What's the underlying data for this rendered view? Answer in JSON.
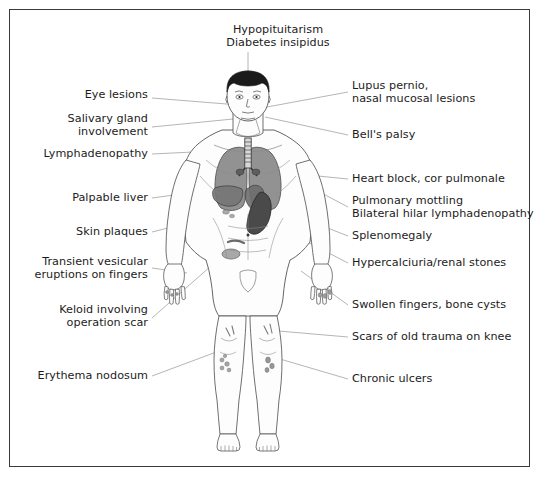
{
  "diagram": {
    "title_label": {
      "text": "Hypopituitarism\nDiabetes insipidus",
      "x": 278,
      "y": 30,
      "anchor": "center"
    },
    "colors": {
      "border": "#3a3a3a",
      "background": "#ffffff",
      "text": "#1c1c1c",
      "leader_line": "#8d8d8d",
      "body_outline": "#555555",
      "skin_fill": "#fdfdfd",
      "hair": "#1a1a1a",
      "lung": "#8a8a8a",
      "lung_outline": "#4a4a4a",
      "liver": "#767676",
      "spleen": "#4a4a4a",
      "organ_mid": "#9a9a9a",
      "lesion": "#9b9b9b"
    },
    "labels_left": [
      {
        "id": "eye-lesions",
        "text": "Eye lesions",
        "x": 148,
        "y": 94,
        "lines": 1
      },
      {
        "id": "salivary-gland-involvement",
        "text": "Salivary gland\ninvolvement",
        "x": 148,
        "y": 118,
        "lines": 2
      },
      {
        "id": "lymphadenopathy",
        "text": "Lymphadenopathy",
        "x": 148,
        "y": 150,
        "lines": 1
      },
      {
        "id": "palpable-liver",
        "text": "Palpable liver",
        "x": 148,
        "y": 194,
        "lines": 1
      },
      {
        "id": "skin-plaques",
        "text": "Skin plaques",
        "x": 148,
        "y": 228,
        "lines": 1
      },
      {
        "id": "transient-vesicular-eruptions-on-fingers",
        "text": "Transient vesicular\neruptions on fingers",
        "x": 148,
        "y": 260,
        "lines": 2
      },
      {
        "id": "keloid-involving-operation-scar",
        "text": "Keloid involving\noperation scar",
        "x": 148,
        "y": 308,
        "lines": 2
      },
      {
        "id": "erythema-nodosum",
        "text": "Erythema nodosum",
        "x": 148,
        "y": 372,
        "lines": 1
      }
    ],
    "labels_right": [
      {
        "id": "lupus-pernio-nasal-mucosal-lesions",
        "text": "Lupus pernio,\nnasal mucosal lesions",
        "x": 352,
        "y": 84,
        "lines": 2
      },
      {
        "id": "bells-palsy",
        "text": "Bell's palsy",
        "x": 352,
        "y": 131,
        "lines": 1
      },
      {
        "id": "heart-block-cor-pulmonale",
        "text": "Heart block, cor pulmonale",
        "x": 352,
        "y": 175,
        "lines": 1
      },
      {
        "id": "pulmonary-mottling-bilateral-hilar-lymphadenopathy",
        "text": "Pulmonary mottling\nBilateral hilar lymphadenopathy",
        "x": 352,
        "y": 199,
        "lines": 2
      },
      {
        "id": "splenomegaly",
        "text": "Splenomegaly",
        "x": 352,
        "y": 232,
        "lines": 1
      },
      {
        "id": "hypercalciuria-renal-stones",
        "text": "Hypercalciuria/renal stones",
        "x": 352,
        "y": 259,
        "lines": 1
      },
      {
        "id": "swollen-fingers-bone-cysts",
        "text": "Swollen fingers, bone cysts",
        "x": 352,
        "y": 301,
        "lines": 1
      },
      {
        "id": "scars-of-old-trauma-on-knee",
        "text": "Scars of old trauma on knee",
        "x": 352,
        "y": 333,
        "lines": 1
      },
      {
        "id": "chronic-ulcers",
        "text": "Chronic ulcers",
        "x": 352,
        "y": 375,
        "lines": 1
      }
    ],
    "leader_lines": [
      {
        "id": "leader-hypopituitarism",
        "points": "248,52 248,74"
      },
      {
        "id": "leader-eye-lesions",
        "points": "152,98 238,106"
      },
      {
        "id": "leader-salivary-gland",
        "points": "152,127 232,120"
      },
      {
        "id": "leader-lymphadenopathy",
        "points": "152,154 216,150"
      },
      {
        "id": "leader-palpable-liver",
        "points": "152,198 232,188"
      },
      {
        "id": "leader-skin-plaques",
        "points": "152,232 228,214"
      },
      {
        "id": "leader-transient-vesicular",
        "points": "152,268 186,272"
      },
      {
        "id": "leader-keloid",
        "points": "152,318 236,244"
      },
      {
        "id": "leader-erythema-nodosum",
        "points": "152,376 218,352"
      },
      {
        "id": "leader-lupus-pernio",
        "points": "348,92 268,106"
      },
      {
        "id": "leader-bells-palsy",
        "points": "348,135 266,118"
      },
      {
        "id": "leader-heart-block",
        "points": "348,179 268,172"
      },
      {
        "id": "leader-pulmonary-mottling",
        "points": "348,207 264,163"
      },
      {
        "id": "leader-splenomegaly",
        "points": "348,236 266,204"
      },
      {
        "id": "leader-hypercalciuria",
        "points": "348,263 262,218"
      },
      {
        "id": "leader-swollen-fingers",
        "points": "348,305 300,272"
      },
      {
        "id": "leader-scars-knee",
        "points": "348,337 266,330"
      },
      {
        "id": "leader-chronic-ulcers",
        "points": "348,379 272,358"
      }
    ],
    "anatomy_parts": [
      "head",
      "hair",
      "face",
      "neck",
      "shoulders",
      "torso",
      "arms",
      "hands",
      "fingers",
      "lungs",
      "trachea",
      "heart",
      "liver",
      "spleen",
      "abdomen",
      "pelvis",
      "legs",
      "knees",
      "shins",
      "feet"
    ]
  }
}
